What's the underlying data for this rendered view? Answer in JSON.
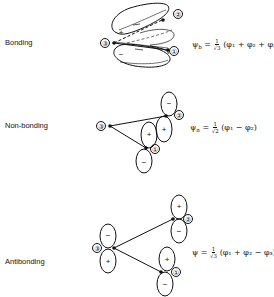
{
  "rows": [
    {
      "label": "Bonding",
      "equation": {
        "psi": "ψ",
        "sub": "b",
        "eq": "=",
        "num": "1",
        "den": "√3",
        "terms": "(φ₁ + φ₂ + φ₃)"
      },
      "atoms": [
        "①",
        "②",
        "③"
      ],
      "signs": [
        "+",
        "−"
      ]
    },
    {
      "label": "Non-bonding",
      "equation": {
        "psi": "ψ",
        "sub": "n",
        "eq": "=",
        "num": "1",
        "den": "√2",
        "terms": "(φ₁ − φ₂)"
      },
      "atoms": [
        "①",
        "②",
        "③"
      ],
      "signs": [
        "+",
        "−",
        "+",
        "−"
      ]
    },
    {
      "label": "Antibonding",
      "equation": {
        "psi": "ψ",
        "sub": "",
        "eq": "=",
        "num": "1",
        "den": "√3",
        "terms": "(φ₁ + φ₂ − φ₃)"
      },
      "atoms": [
        "①",
        "②",
        "③"
      ],
      "signs": [
        "+",
        "−",
        "+",
        "−",
        "+",
        "−"
      ]
    }
  ]
}
